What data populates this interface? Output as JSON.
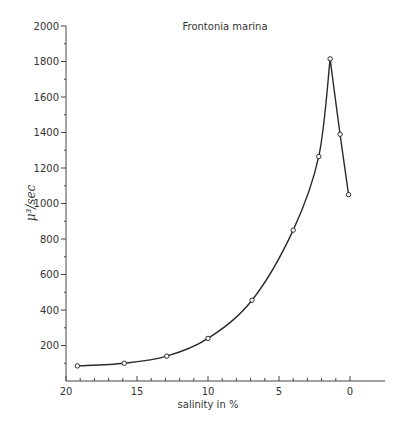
{
  "chart_data": {
    "type": "line",
    "title": "Frontonia marina",
    "xlabel": "salinity in %",
    "ylabel": "μ³/sec",
    "xlim": [
      20,
      0
    ],
    "ylim": [
      0,
      2000
    ],
    "x_reversed": true,
    "grid": false,
    "legend": null,
    "xticks": [
      20,
      15,
      10,
      5,
      0
    ],
    "xtick_labels": [
      "20",
      "15",
      "10",
      "5",
      "0"
    ],
    "x_minor_step": 1,
    "yticks": [
      200,
      400,
      600,
      800,
      1000,
      1200,
      1400,
      1600,
      1800,
      2000
    ],
    "ytick_labels": [
      "200",
      "400",
      "600",
      "800",
      "1000",
      "1200",
      "1400",
      "1600",
      "1800",
      "2000"
    ],
    "y_minor_step": 100,
    "series": [
      {
        "name": "Frontonia marina",
        "marker": "open-circle",
        "x": [
          19.2,
          15.9,
          12.9,
          10.0,
          6.9,
          4.0,
          2.2,
          1.4,
          0.7,
          0.1
        ],
        "y": [
          85,
          100,
          140,
          240,
          455,
          850,
          1265,
          1815,
          1390,
          1050
        ]
      }
    ]
  },
  "colors": {
    "line": "#2a2a2a",
    "axis": "#444444",
    "background": "#ffffff"
  }
}
